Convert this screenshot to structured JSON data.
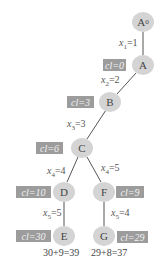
{
  "nodes": [
    {
      "id": "A0",
      "label": "A",
      "sub": "0"
    },
    {
      "id": "A",
      "label": "A",
      "sub": ""
    },
    {
      "id": "B",
      "label": "B",
      "sub": ""
    },
    {
      "id": "C",
      "label": "C",
      "sub": ""
    },
    {
      "id": "D",
      "label": "D",
      "sub": ""
    },
    {
      "id": "E",
      "label": "E",
      "sub": ""
    },
    {
      "id": "F",
      "label": "F",
      "sub": ""
    },
    {
      "id": "G",
      "label": "G",
      "sub": ""
    }
  ],
  "cl_labels": {
    "A": "cl=0",
    "B": "cl=3",
    "C": "cl=6",
    "D": "cl=10",
    "E": "cl=30",
    "F": "cl=9",
    "G": "cl=29"
  },
  "edges": [
    {
      "from": "A0",
      "to": "A",
      "var": "x",
      "sub": "1",
      "val": "=1"
    },
    {
      "from": "A",
      "to": "B",
      "var": "x",
      "sub": "2",
      "val": "=2"
    },
    {
      "from": "B",
      "to": "C",
      "var": "x",
      "sub": "3",
      "val": "=3"
    },
    {
      "from": "C",
      "to": "D",
      "var": "x",
      "sub": "4",
      "val": "=4"
    },
    {
      "from": "C",
      "to": "F",
      "var": "x",
      "sub": "4",
      "val": "=5"
    },
    {
      "from": "D",
      "to": "E",
      "var": "x",
      "sub": "5",
      "val": "=5"
    },
    {
      "from": "F",
      "to": "G",
      "var": "x",
      "sub": "5",
      "val": "=4"
    }
  ],
  "sums": {
    "E": "30+9=39",
    "G": "29+8=37"
  },
  "colors": {
    "node_fill": "#d4d4d4",
    "cl_box": "#9c9c9c",
    "edge": "#555555"
  }
}
